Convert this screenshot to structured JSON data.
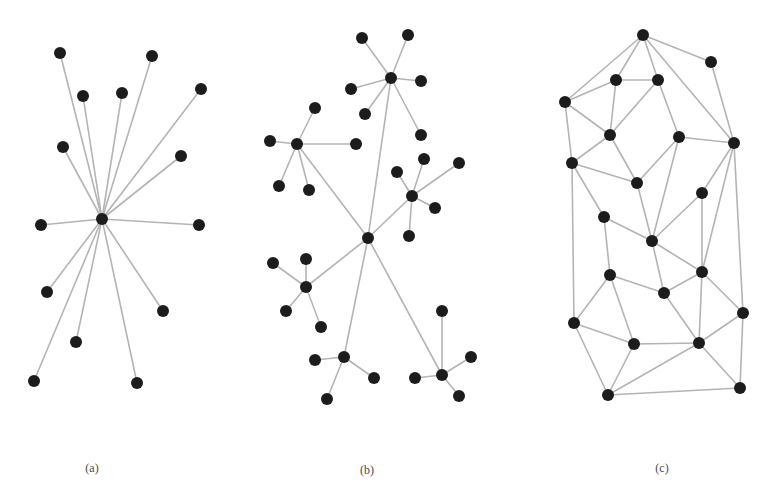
{
  "figure": {
    "style": {
      "node_color": "#1c1c1c",
      "edge_color": "#b4b4b4",
      "node_radius": 6,
      "background": "#ffffff"
    },
    "panels": [
      {
        "id": "a",
        "label": "(a)",
        "label_pos": [
          92,
          468
        ],
        "description": "star topology",
        "nodes": [
          [
            102,
            219
          ],
          [
            60,
            53
          ],
          [
            152,
            56
          ],
          [
            83,
            96
          ],
          [
            122,
            93
          ],
          [
            201,
            89
          ],
          [
            63,
            147
          ],
          [
            181,
            156
          ],
          [
            41,
            225
          ],
          [
            199,
            225
          ],
          [
            47,
            292
          ],
          [
            163,
            311
          ],
          [
            76,
            342
          ],
          [
            34,
            381
          ],
          [
            137,
            383
          ]
        ],
        "edges": [
          [
            0,
            1
          ],
          [
            0,
            2
          ],
          [
            0,
            3
          ],
          [
            0,
            4
          ],
          [
            0,
            5
          ],
          [
            0,
            6
          ],
          [
            0,
            7
          ],
          [
            0,
            8
          ],
          [
            0,
            9
          ],
          [
            0,
            10
          ],
          [
            0,
            11
          ],
          [
            0,
            12
          ],
          [
            0,
            13
          ],
          [
            0,
            14
          ]
        ]
      },
      {
        "id": "b",
        "label": "(b)",
        "label_pos": [
          367,
          470
        ],
        "description": "hierarchical / clustered tree topology",
        "nodes": [
          [
            368,
            238
          ],
          [
            391,
            78
          ],
          [
            362,
            38
          ],
          [
            408,
            35
          ],
          [
            351,
            89
          ],
          [
            421,
            81
          ],
          [
            365,
            114
          ],
          [
            421,
            135
          ],
          [
            297,
            144
          ],
          [
            315,
            108
          ],
          [
            270,
            141
          ],
          [
            356,
            144
          ],
          [
            279,
            186
          ],
          [
            309,
            190
          ],
          [
            412,
            196
          ],
          [
            397,
            172
          ],
          [
            424,
            159
          ],
          [
            459,
            163
          ],
          [
            435,
            208
          ],
          [
            409,
            236
          ],
          [
            306,
            287
          ],
          [
            273,
            263
          ],
          [
            306,
            259
          ],
          [
            286,
            311
          ],
          [
            321,
            327
          ],
          [
            344,
            357
          ],
          [
            315,
            360
          ],
          [
            374,
            378
          ],
          [
            327,
            399
          ],
          [
            442,
            375
          ],
          [
            442,
            311
          ],
          [
            471,
            357
          ],
          [
            415,
            378
          ],
          [
            459,
            396
          ]
        ],
        "edges": [
          [
            0,
            1
          ],
          [
            0,
            8
          ],
          [
            0,
            14
          ],
          [
            0,
            20
          ],
          [
            0,
            25
          ],
          [
            0,
            29
          ],
          [
            1,
            2
          ],
          [
            1,
            3
          ],
          [
            1,
            4
          ],
          [
            1,
            5
          ],
          [
            1,
            6
          ],
          [
            1,
            7
          ],
          [
            8,
            9
          ],
          [
            8,
            10
          ],
          [
            8,
            11
          ],
          [
            8,
            12
          ],
          [
            8,
            13
          ],
          [
            14,
            15
          ],
          [
            14,
            16
          ],
          [
            14,
            17
          ],
          [
            14,
            18
          ],
          [
            14,
            19
          ],
          [
            20,
            21
          ],
          [
            20,
            22
          ],
          [
            20,
            23
          ],
          [
            20,
            24
          ],
          [
            25,
            26
          ],
          [
            25,
            27
          ],
          [
            25,
            28
          ],
          [
            29,
            30
          ],
          [
            29,
            31
          ],
          [
            29,
            32
          ],
          [
            29,
            33
          ]
        ]
      },
      {
        "id": "c",
        "label": "(c)",
        "label_pos": [
          662,
          468
        ],
        "description": "mesh topology",
        "nodes": [
          [
            643,
            35
          ],
          [
            711,
            62
          ],
          [
            616,
            80
          ],
          [
            658,
            80
          ],
          [
            565,
            102
          ],
          [
            610,
            135
          ],
          [
            679,
            137
          ],
          [
            734,
            143
          ],
          [
            572,
            163
          ],
          [
            637,
            183
          ],
          [
            702,
            193
          ],
          [
            604,
            217
          ],
          [
            652,
            241
          ],
          [
            610,
            275
          ],
          [
            702,
            272
          ],
          [
            664,
            293
          ],
          [
            743,
            313
          ],
          [
            574,
            323
          ],
          [
            634,
            344
          ],
          [
            699,
            343
          ],
          [
            608,
            395
          ],
          [
            740,
            388
          ]
        ],
        "edges": [
          [
            0,
            1
          ],
          [
            0,
            2
          ],
          [
            0,
            3
          ],
          [
            0,
            4
          ],
          [
            0,
            7
          ],
          [
            1,
            7
          ],
          [
            2,
            3
          ],
          [
            2,
            4
          ],
          [
            2,
            5
          ],
          [
            3,
            5
          ],
          [
            3,
            6
          ],
          [
            4,
            5
          ],
          [
            4,
            8
          ],
          [
            5,
            8
          ],
          [
            5,
            9
          ],
          [
            6,
            7
          ],
          [
            6,
            9
          ],
          [
            6,
            12
          ],
          [
            7,
            10
          ],
          [
            7,
            14
          ],
          [
            7,
            16
          ],
          [
            8,
            9
          ],
          [
            8,
            11
          ],
          [
            8,
            17
          ],
          [
            9,
            12
          ],
          [
            10,
            12
          ],
          [
            10,
            14
          ],
          [
            11,
            12
          ],
          [
            11,
            13
          ],
          [
            12,
            14
          ],
          [
            12,
            15
          ],
          [
            13,
            15
          ],
          [
            13,
            17
          ],
          [
            13,
            18
          ],
          [
            14,
            15
          ],
          [
            14,
            16
          ],
          [
            14,
            19
          ],
          [
            15,
            19
          ],
          [
            16,
            19
          ],
          [
            16,
            21
          ],
          [
            17,
            18
          ],
          [
            17,
            20
          ],
          [
            18,
            19
          ],
          [
            18,
            20
          ],
          [
            19,
            20
          ],
          [
            19,
            21
          ],
          [
            20,
            21
          ]
        ]
      }
    ]
  }
}
